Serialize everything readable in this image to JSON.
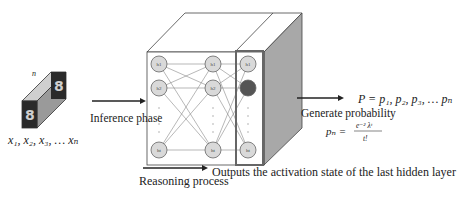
{
  "input": {
    "depth_label": "n",
    "sequence_label": "x₁, x₂, x₃, … xₙ",
    "image_glyph": "8"
  },
  "arrows": {
    "inference_label": "Inference phase",
    "reasoning_label": "Reasoning process",
    "generate_label": "Generate probability"
  },
  "network": {
    "columns": [
      {
        "nodes": [
          "h₁",
          "h₂",
          "hₜ"
        ]
      },
      {
        "nodes": [
          "h₁",
          "h₂",
          "hₜ"
        ]
      },
      {
        "nodes": [
          "h₁",
          "h₂",
          "hₜ"
        ],
        "highlighted_index": 1
      }
    ],
    "output_caption": "Outputs the activation state of the last hidden layer"
  },
  "output": {
    "probability_set": "P = p₁, p₂, p₃, … pₙ",
    "formula_lhs": "pₙ =",
    "formula_numerator": "e⁻² λᵗ",
    "formula_denominator": "t!"
  },
  "colors": {
    "node_fill": "#d9d9d9",
    "node_highlight": "#555555",
    "side_face": "#a6a6a6",
    "stroke": "#555555",
    "highlight_box": "#666666"
  }
}
